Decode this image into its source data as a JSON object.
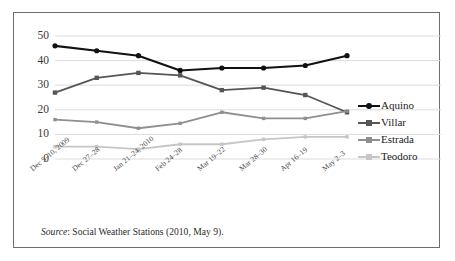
{
  "chart_data": {
    "type": "line",
    "title": "",
    "xlabel": "",
    "ylabel": "",
    "ylim": [
      0,
      50
    ],
    "yticks": [
      0,
      10,
      20,
      30,
      40,
      50
    ],
    "grid": true,
    "legend_position": "right",
    "categories": [
      "Dec 5–10, 2009",
      "Dec 27–28",
      "Jan 21–24, 2010",
      "Feb 24–28",
      "Mar 19–22",
      "Mar 28–30",
      "Apr 16–19",
      "May 2–3"
    ],
    "series": [
      {
        "name": "Aquino",
        "color": "#111111",
        "marker": "circle",
        "values": [
          46,
          44,
          42,
          36,
          37,
          37,
          38,
          42
        ]
      },
      {
        "name": "Villar",
        "color": "#565656",
        "marker": "square",
        "values": [
          27,
          33,
          35,
          34,
          28,
          29,
          26,
          19
        ]
      },
      {
        "name": "Estrada",
        "color": "#8f8f8f",
        "marker": "square",
        "values": [
          16,
          15,
          12.5,
          14.5,
          19,
          16.5,
          16.5,
          19.5
        ]
      },
      {
        "name": "Teodoro",
        "color": "#c6c6c6",
        "marker": "square",
        "values": [
          5,
          5,
          4,
          6,
          6,
          8,
          9,
          9
        ]
      }
    ]
  },
  "legend": {
    "entries": [
      "Aquino",
      "Villar",
      "Estrada",
      "Teodoro"
    ]
  },
  "source": {
    "label": "Source",
    "text": ": Social Weather Stations (2010, May 9)."
  },
  "colors": {
    "frame": "#6e6e6e",
    "grid": "#dcdcdc",
    "background": "#ffffff",
    "text": "#2b2b2b"
  }
}
